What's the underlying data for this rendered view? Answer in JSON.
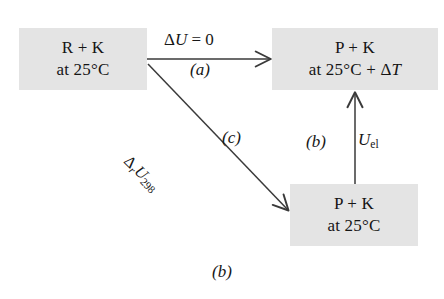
{
  "figure": {
    "caption": "(b)",
    "background_color": "#ffffff",
    "box_fill_color": "#e4e4e4",
    "line_color": "#3a3a3a",
    "text_color": "#151515"
  },
  "boxes": [
    {
      "id": "reactants",
      "name": "box-reactants",
      "line1": "R + K",
      "line2_prefix": "at 25°C",
      "line2_suffix": "",
      "line2_italic": ""
    },
    {
      "id": "products_hot",
      "name": "box-products-hot",
      "line1": "P + K",
      "line2_prefix": "at 25°C + Δ",
      "line2_italic": "T",
      "line2_suffix": ""
    },
    {
      "id": "products_cool",
      "name": "box-products-cool",
      "line1": "P + K",
      "line2_prefix": "at 25°C",
      "line2_italic": "",
      "line2_suffix": ""
    }
  ],
  "arrows": {
    "horizontal": {
      "name": "arrow-horizontal",
      "from": "reactants",
      "to": "products_hot",
      "label_above_delta": "Δ",
      "label_above_symbol": "U",
      "label_above_value": " = 0",
      "label_below": "(a)"
    },
    "vertical": {
      "name": "arrow-vertical",
      "from": "products_cool",
      "to": "products_hot",
      "label_step": "(b)",
      "label_symbol": "U",
      "label_subscript": "el"
    },
    "diagonal": {
      "name": "arrow-diagonal",
      "from": "reactants",
      "to": "products_cool",
      "label_delta": "Δ",
      "label_delta_sub": "r",
      "label_symbol": "U",
      "label_subscript": "298",
      "label_step": "(c)"
    }
  }
}
